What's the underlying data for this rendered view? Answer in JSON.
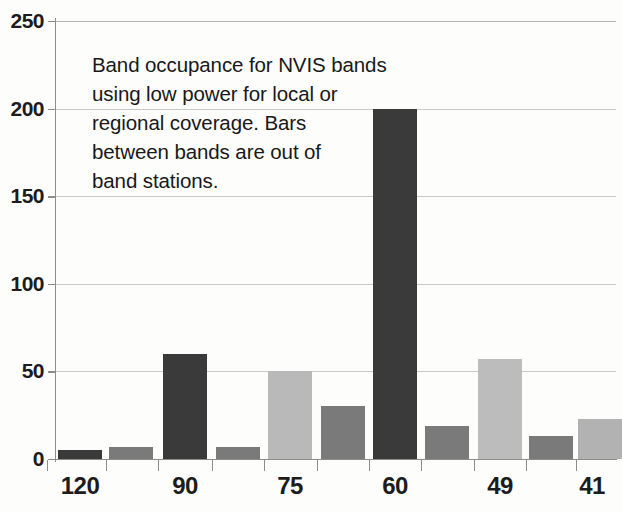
{
  "chart_data": {
    "type": "bar",
    "title": "",
    "subtitle": "",
    "xlabel": "",
    "ylabel": "",
    "ylim": [
      0,
      250
    ],
    "yticks": [
      0,
      50,
      100,
      150,
      200,
      250
    ],
    "ytick_labels": [
      "0",
      "50",
      "100",
      "150",
      "200",
      "250"
    ],
    "grid": true,
    "legend": null,
    "xtick_labels": [
      "120",
      "90",
      "75",
      "60",
      "49",
      "41"
    ],
    "xtick_positions": [
      80,
      185,
      290,
      395,
      500,
      592
    ],
    "categories": [
      "120",
      "",
      "90",
      "",
      "75",
      "",
      "60",
      "",
      "49",
      "",
      "41"
    ],
    "values": [
      5,
      7,
      60,
      7,
      50,
      30,
      200,
      19,
      57,
      13,
      23
    ],
    "bar_colors": [
      "#3a3a3a",
      "#7a7a7a",
      "#3a3a3a",
      "#7a7a7a",
      "#b9b9b9",
      "#7a7a7a",
      "#3a3a3a",
      "#7a7a7a",
      "#bcbcbc",
      "#7a7a7a",
      "#b2b2b2"
    ],
    "bar_x_centers": [
      80,
      131,
      185,
      238,
      290,
      343,
      395,
      447,
      500,
      551,
      600
    ],
    "bar_width": 44,
    "annotation": {
      "text": "Band occupance for NVIS bands using low power for local or regional coverage. Bars between bands are out of band stations.",
      "lines": [
        "Band occupance for NVIS bands",
        "using low power for local or",
        "regional coverage. Bars",
        "between bands are out of",
        "band stations."
      ]
    },
    "colors": {
      "dark_bar": "#3a3a3a",
      "mid_bar": "#7a7a7a",
      "light_bar": "#b9b9b9",
      "gridline": "#c9c9c9",
      "axis": "#8d8d8d",
      "text": "#1c1c1c",
      "background": "#fdfdfc"
    }
  }
}
